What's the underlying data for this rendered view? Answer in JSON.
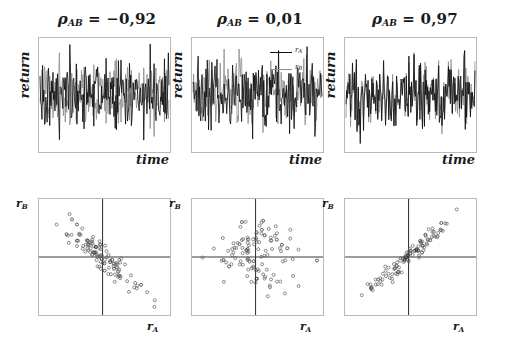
{
  "figure": {
    "caption_present": false,
    "colors": {
      "series_a": "#111111",
      "series_b": "#8d8d8d",
      "frame": "#b9b9b9",
      "axis": "#333333",
      "background": "#ffffff"
    }
  },
  "panels": [
    {
      "title_prefix": "ρ",
      "title_subscript": "AB",
      "title_equals": "=",
      "title_value": "−0,92",
      "title_full": "ρAB = −0,92",
      "correlation": -0.92,
      "axis_x_top": "time",
      "axis_y_top": "return",
      "axis_x_bottom": "r",
      "axis_x_bottom_sub": "A",
      "axis_y_bottom": "r",
      "axis_y_bottom_sub": "B"
    },
    {
      "title_prefix": "ρ",
      "title_subscript": "AB",
      "title_equals": "=",
      "title_value": "0,01",
      "title_full": "ρAB = 0,01",
      "correlation": 0.01,
      "axis_x_top": "time",
      "axis_y_top": "return",
      "axis_x_bottom": "r",
      "axis_x_bottom_sub": "A",
      "axis_y_bottom": "r",
      "axis_y_bottom_sub": "B"
    },
    {
      "title_prefix": "ρ",
      "title_subscript": "AB",
      "title_equals": "=",
      "title_value": "0,97",
      "title_full": "ρAB = 0,97",
      "correlation": 0.97,
      "axis_x_top": "time",
      "axis_y_top": "return",
      "axis_x_bottom": "r",
      "axis_x_bottom_sub": "A",
      "axis_y_bottom": "r",
      "axis_y_bottom_sub": "B"
    }
  ],
  "legend": {
    "position": "top-right of middle time-series panel",
    "entries": [
      {
        "label": "r",
        "sub": "A",
        "color": "#111111"
      },
      {
        "label": "r",
        "sub": "B",
        "color": "#8d8d8d"
      }
    ]
  },
  "chart_data": [
    {
      "type": "line",
      "panel": "top-left",
      "title": "ρAB = −0,92",
      "xlabel": "time",
      "ylabel": "return",
      "grid": false,
      "legend_position": "none",
      "axis_ticks": "none",
      "n_points": 200,
      "series": [
        {
          "name": "r_A",
          "color": "#111111",
          "seed": 11,
          "amplitude": 1.0,
          "correlation_to_a": 1.0
        },
        {
          "name": "r_B",
          "color": "#8d8d8d",
          "seed": 11,
          "amplitude": 0.85,
          "correlation_to_a": -0.92
        }
      ]
    },
    {
      "type": "line",
      "panel": "top-middle",
      "title": "ρAB = 0,01",
      "xlabel": "time",
      "ylabel": "return",
      "grid": false,
      "legend_position": "top-right",
      "axis_ticks": "none",
      "n_points": 200,
      "series": [
        {
          "name": "r_A",
          "color": "#111111",
          "seed": 23,
          "amplitude": 1.0,
          "correlation_to_a": 1.0
        },
        {
          "name": "r_B",
          "color": "#8d8d8d",
          "seed": 77,
          "amplitude": 0.9,
          "correlation_to_a": 0.01
        }
      ]
    },
    {
      "type": "line",
      "panel": "top-right",
      "title": "ρAB = 0,97",
      "xlabel": "time",
      "ylabel": "return",
      "grid": false,
      "legend_position": "none",
      "axis_ticks": "none",
      "n_points": 200,
      "series": [
        {
          "name": "r_A",
          "color": "#111111",
          "seed": 41,
          "amplitude": 1.0,
          "correlation_to_a": 1.0
        },
        {
          "name": "r_B",
          "color": "#8d8d8d",
          "seed": 41,
          "amplitude": 0.95,
          "correlation_to_a": 0.97
        }
      ]
    },
    {
      "type": "scatter",
      "panel": "bottom-left",
      "xlabel": "r_A",
      "ylabel": "r_B",
      "grid": false,
      "axis_style": "crosshair through origin",
      "marker": "open circle",
      "n_points": 110,
      "correlation": -0.92,
      "xlim": [
        -1,
        1
      ],
      "ylim": [
        -1,
        1
      ],
      "seed": 5
    },
    {
      "type": "scatter",
      "panel": "bottom-middle",
      "xlabel": "r_A",
      "ylabel": "r_B",
      "grid": false,
      "axis_style": "crosshair through origin",
      "marker": "open circle",
      "n_points": 110,
      "correlation": 0.01,
      "xlim": [
        -1,
        1
      ],
      "ylim": [
        -1,
        1
      ],
      "seed": 9
    },
    {
      "type": "scatter",
      "panel": "bottom-right",
      "xlabel": "r_A",
      "ylabel": "r_B",
      "grid": false,
      "axis_style": "crosshair through origin",
      "marker": "open circle",
      "n_points": 110,
      "correlation": 0.97,
      "xlim": [
        -1,
        1
      ],
      "ylim": [
        -1,
        1
      ],
      "seed": 17
    }
  ]
}
